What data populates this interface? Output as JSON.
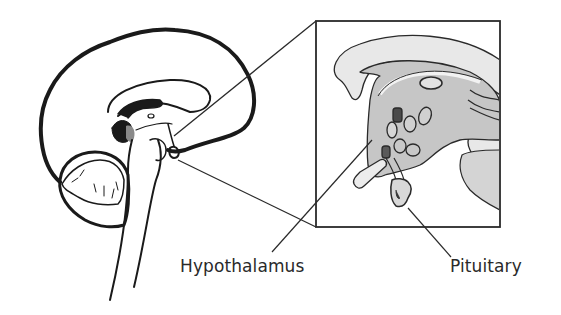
{
  "diagram": {
    "type": "anatomical-illustration",
    "labels": {
      "hypothalamus": "Hypothalamus",
      "pituitary": "Pituitary"
    },
    "colors": {
      "outline": "#1a1a1a",
      "inset_fill_light": "#e6e6e6",
      "inset_fill_mid": "#c8c8c8",
      "inset_fill_dark": "#4a4a4a",
      "highlight_region": "#8a8a8a",
      "text": "#2a2a2a"
    }
  }
}
